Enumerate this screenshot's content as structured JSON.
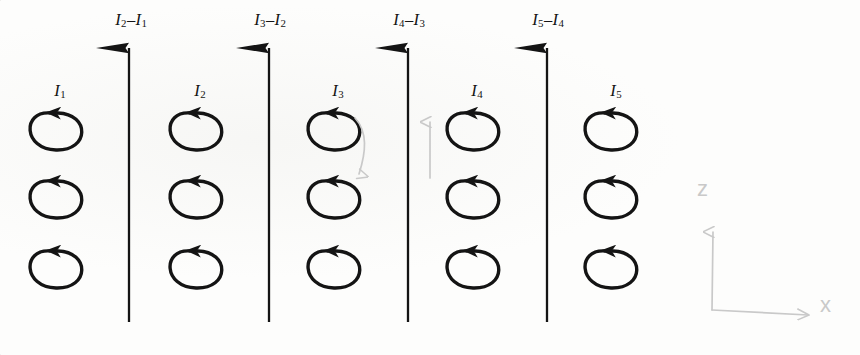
{
  "figure": {
    "background_color": "#fdfdfc",
    "ink_color": "#141414",
    "pencil_color": "#c9c9c9"
  },
  "top_labels": [
    {
      "id": "diff-2-1",
      "text": "I2–I1",
      "main": "I",
      "sub": "2",
      "minus": "–",
      "main2": "I",
      "sub2": "1",
      "x": 131,
      "y": 14
    },
    {
      "id": "diff-3-2",
      "text": "I3–I2",
      "main": "I",
      "sub": "3",
      "minus": "–",
      "main2": "I",
      "sub2": "2",
      "x": 270,
      "y": 14
    },
    {
      "id": "diff-4-3",
      "text": "I4–I3",
      "main": "I",
      "sub": "4",
      "minus": "–",
      "main2": "I",
      "sub2": "3",
      "x": 409,
      "y": 14
    },
    {
      "id": "diff-5-4",
      "text": "I5–I4",
      "main": "I",
      "sub": "5",
      "minus": "–",
      "main2": "I",
      "sub2": "4",
      "x": 548,
      "y": 14
    }
  ],
  "loop_labels": [
    {
      "id": "current-1",
      "main": "I",
      "sub": "1",
      "x": 60,
      "y": 85
    },
    {
      "id": "current-2",
      "main": "I",
      "sub": "2",
      "x": 200,
      "y": 85
    },
    {
      "id": "current-3",
      "main": "I",
      "sub": "3",
      "x": 338,
      "y": 85
    },
    {
      "id": "current-4",
      "main": "I",
      "sub": "4",
      "x": 477,
      "y": 85
    },
    {
      "id": "current-5",
      "main": "I",
      "sub": "5",
      "x": 616,
      "y": 85
    }
  ],
  "loop_columns": [
    55,
    195,
    333,
    472,
    610
  ],
  "loop_rows": [
    130,
    198,
    268
  ],
  "loop_geometry": {
    "rx": 30,
    "ry": 20,
    "stroke_width": 3.4
  },
  "wires": [
    {
      "id": "wire-1",
      "x": 129,
      "y_top": 48,
      "y_bottom": 322
    },
    {
      "id": "wire-2",
      "x": 269,
      "y_top": 48,
      "y_bottom": 322
    },
    {
      "id": "wire-3",
      "x": 408,
      "y_top": 48,
      "y_bottom": 322
    },
    {
      "id": "wire-4",
      "x": 547,
      "y_top": 48,
      "y_bottom": 322
    }
  ],
  "pencil_marks": {
    "z_label": {
      "text": "z",
      "x": 697,
      "y": 178
    },
    "x_label": {
      "text": "x",
      "x": 820,
      "y": 305
    },
    "z_axis_arrow": {
      "x": 712,
      "y_top": 235,
      "y_bottom": 310
    },
    "x_axis_arrow": {
      "x_left": 712,
      "x_right": 812,
      "y": 312
    },
    "curve_down_arrow": {
      "x": 360,
      "y_top": 120,
      "y_bottom": 175
    },
    "small_up_arrow": {
      "x": 430,
      "y_top": 120,
      "y_bottom": 178
    }
  }
}
